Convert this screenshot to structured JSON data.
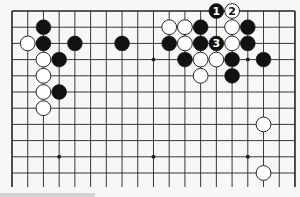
{
  "board": {
    "size": 19,
    "visible_rows": 11,
    "bottom_open": true,
    "origin_x": 12,
    "origin_y": 11,
    "spacing_x": 15.72,
    "spacing_y": 16.2,
    "line_color": "#222222",
    "background_color": "#f7f7f7",
    "star_points": [
      [
        3,
        3
      ],
      [
        9,
        3
      ],
      [
        15,
        3
      ],
      [
        3,
        9
      ],
      [
        9,
        9
      ],
      [
        15,
        9
      ]
    ],
    "stones": [
      {
        "color": "black",
        "col": 2,
        "row": 1
      },
      {
        "color": "white",
        "col": 1,
        "row": 2
      },
      {
        "color": "black",
        "col": 2,
        "row": 2
      },
      {
        "color": "black",
        "col": 4,
        "row": 2
      },
      {
        "color": "black",
        "col": 7,
        "row": 2
      },
      {
        "color": "white",
        "col": 2,
        "row": 3
      },
      {
        "color": "black",
        "col": 3,
        "row": 3
      },
      {
        "color": "white",
        "col": 2,
        "row": 4
      },
      {
        "color": "white",
        "col": 2,
        "row": 5
      },
      {
        "color": "black",
        "col": 3,
        "row": 5
      },
      {
        "color": "white",
        "col": 2,
        "row": 6
      },
      {
        "color": "black",
        "col": 13,
        "row": 0,
        "label": "1"
      },
      {
        "color": "white",
        "col": 14,
        "row": 0,
        "label": "2"
      },
      {
        "color": "white",
        "col": 10,
        "row": 1
      },
      {
        "color": "white",
        "col": 11,
        "row": 1
      },
      {
        "color": "black",
        "col": 12,
        "row": 1
      },
      {
        "color": "white",
        "col": 14,
        "row": 1
      },
      {
        "color": "black",
        "col": 15,
        "row": 1
      },
      {
        "color": "black",
        "col": 10,
        "row": 2
      },
      {
        "color": "white",
        "col": 11,
        "row": 2
      },
      {
        "color": "black",
        "col": 12,
        "row": 2
      },
      {
        "color": "black",
        "col": 13,
        "row": 2,
        "label": "3"
      },
      {
        "color": "white",
        "col": 14,
        "row": 2
      },
      {
        "color": "black",
        "col": 15,
        "row": 2
      },
      {
        "color": "black",
        "col": 11,
        "row": 3
      },
      {
        "color": "white",
        "col": 12,
        "row": 3
      },
      {
        "color": "white",
        "col": 13,
        "row": 3
      },
      {
        "color": "black",
        "col": 14,
        "row": 3
      },
      {
        "color": "black",
        "col": 16,
        "row": 3
      },
      {
        "color": "white",
        "col": 12,
        "row": 4
      },
      {
        "color": "black",
        "col": 14,
        "row": 4
      },
      {
        "color": "white",
        "col": 16,
        "row": 7
      },
      {
        "color": "white",
        "col": 16,
        "row": 10
      }
    ]
  },
  "move_labels": [
    "1",
    "2",
    "3"
  ]
}
